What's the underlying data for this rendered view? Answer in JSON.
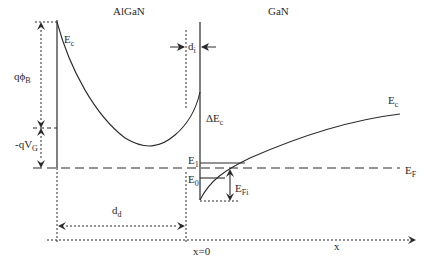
{
  "regions": {
    "left": "AlGaN",
    "right": "GaN"
  },
  "labels": {
    "ec_left": {
      "main": "E",
      "sub": "c"
    },
    "ec_right": {
      "main": "E",
      "sub": "c"
    },
    "di": {
      "main": "d",
      "sub": "i"
    },
    "q_phi_b": {
      "main": "qϕ",
      "sub": "B"
    },
    "q_vg": {
      "main": "-qV",
      "sub": "G"
    },
    "delta_ec": {
      "main": "ΔE",
      "sub": "c"
    },
    "e1": {
      "main": "E",
      "sub": "1"
    },
    "e0": {
      "main": "E",
      "sub": "0"
    },
    "ef": {
      "main": "E",
      "sub": "F"
    },
    "efi": {
      "main": "E",
      "sub": "Fi"
    },
    "dd": {
      "main": "d",
      "sub": "d"
    },
    "x0": "x=0",
    "x_axis": "x"
  },
  "colors": {
    "line": "#2a2a2a",
    "background": "#ffffff"
  }
}
